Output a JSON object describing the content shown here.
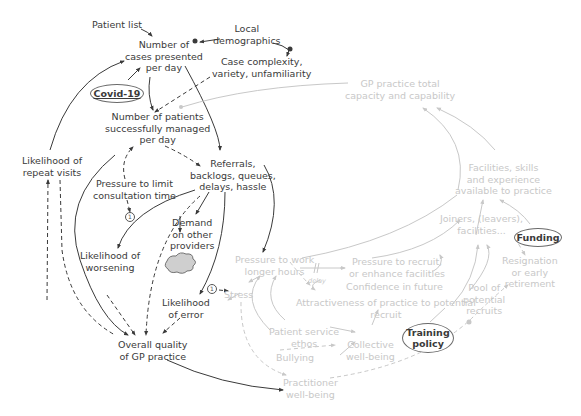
{
  "diagram": {
    "type": "causal-loop-diagram",
    "colors": {
      "active": "#3a3a3a",
      "faded": "#c8c8c8",
      "cloud_fill": "#cfcfcf"
    },
    "nodes": {
      "patient_list": "Patient list",
      "local_demographics": [
        "Local",
        "demographics"
      ],
      "cases_presented": [
        "Number of",
        "cases presented",
        "per day"
      ],
      "case_complexity": [
        "Case complexity,",
        "variety, unfamiliarity"
      ],
      "covid": "Covid-19",
      "patients_managed": [
        "Number of patients",
        "successfully managed",
        "per day"
      ],
      "repeat_visits": [
        "Likelihood  of",
        "repeat visits"
      ],
      "referrals": [
        "Referrals,",
        "backlogs, queues,",
        "delays, hassle"
      ],
      "pressure_consult": [
        "Pressure to limit",
        "consultation time"
      ],
      "demand_other": [
        "Demand",
        "on other",
        "providers"
      ],
      "worsening": [
        "Likelihood of",
        "worsening"
      ],
      "error": [
        "Likelihood",
        "of error"
      ],
      "overall_quality": [
        "Overall quality",
        "of GP practice"
      ],
      "gp_capacity": [
        "GP practice total",
        "capacity and capability"
      ],
      "facilities_skills": [
        "Facilities, skills",
        "and experience",
        "available to practice"
      ],
      "joiners": [
        "Joiners, (leavers),",
        "facilities..."
      ],
      "funding": "Funding",
      "pressure_work": [
        "Pressure to work",
        "longer hours"
      ],
      "pressure_recruit": [
        "Pressure to recruit,",
        "or enhance facilities"
      ],
      "confidence": "Confidence in future",
      "attractiveness": [
        "Attractiveness of practice to potential",
        "recruit"
      ],
      "stress": "Stress",
      "resignation": [
        "Resignation",
        "or early",
        "retirement"
      ],
      "pool_recruits": [
        "Pool of",
        "potential",
        "recruits"
      ],
      "training_policy": [
        "Training",
        "policy"
      ],
      "patient_ethos": [
        "Patient service",
        "ethos"
      ],
      "collective_wellbeing": [
        "Collective",
        "well-being"
      ],
      "bullying": "Bullying",
      "practitioner_wellbeing": [
        "Practitioner",
        "well-being"
      ]
    },
    "annotations": {
      "delay": "delay",
      "marker_1": "1"
    }
  }
}
